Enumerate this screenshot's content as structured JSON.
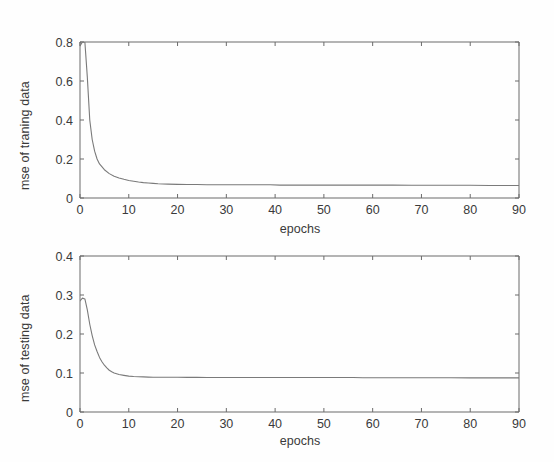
{
  "figure": {
    "background": "#fefefe",
    "axis_color": "#6b6b6b",
    "curve_color": "#7a7a7a",
    "text_color": "#3a3a3a"
  },
  "chart_data": [
    {
      "type": "line",
      "id": "training-mse",
      "title": "",
      "xlabel": "epochs",
      "ylabel": "mse of traning data",
      "xlim": [
        0,
        90
      ],
      "ylim": [
        0,
        0.8
      ],
      "xticks": [
        0,
        10,
        20,
        30,
        40,
        50,
        60,
        70,
        80,
        90
      ],
      "xticklabels": [
        "0",
        "10",
        "20",
        "30",
        "40",
        "50",
        "60",
        "70",
        "80",
        "90"
      ],
      "yticks": [
        0,
        0.2,
        0.4,
        0.6,
        0.8
      ],
      "yticklabels": [
        "0",
        "0.2",
        "0.4",
        "0.6",
        "0.8"
      ],
      "grid": false,
      "legend": "none",
      "series": [
        {
          "name": "mse of traning data",
          "x": [
            0,
            0.5,
            1,
            1.5,
            2,
            2.5,
            3,
            3.5,
            4,
            5,
            6,
            7,
            8,
            9,
            10,
            11,
            12,
            13,
            14,
            15,
            16,
            18,
            20,
            22,
            24,
            26,
            28,
            30,
            33,
            36,
            39,
            41,
            44,
            48,
            52,
            56,
            60,
            64,
            68,
            72,
            76,
            80,
            84,
            88,
            90
          ],
          "y": [
            0.78,
            0.8,
            0.8,
            0.62,
            0.4,
            0.3,
            0.24,
            0.2,
            0.175,
            0.145,
            0.125,
            0.112,
            0.103,
            0.096,
            0.09,
            0.086,
            0.082,
            0.079,
            0.077,
            0.075,
            0.073,
            0.071,
            0.07,
            0.069,
            0.069,
            0.068,
            0.068,
            0.068,
            0.068,
            0.068,
            0.068,
            0.066,
            0.066,
            0.066,
            0.066,
            0.066,
            0.066,
            0.066,
            0.065,
            0.065,
            0.065,
            0.065,
            0.064,
            0.064,
            0.064
          ]
        }
      ]
    },
    {
      "type": "line",
      "id": "testing-mse",
      "title": "",
      "xlabel": "epochs",
      "ylabel": "mse of testing data",
      "xlim": [
        0,
        90
      ],
      "ylim": [
        0,
        0.4
      ],
      "xticks": [
        0,
        10,
        20,
        30,
        40,
        50,
        60,
        70,
        80,
        90
      ],
      "xticklabels": [
        "0",
        "10",
        "20",
        "30",
        "40",
        "50",
        "60",
        "70",
        "80",
        "90"
      ],
      "yticks": [
        0,
        0.1,
        0.2,
        0.3,
        0.4
      ],
      "yticklabels": [
        "0",
        "0.1",
        "0.2",
        "0.3",
        "0.4"
      ],
      "grid": false,
      "legend": "none",
      "series": [
        {
          "name": "mse of testing data",
          "x": [
            0,
            0.5,
            1,
            1.5,
            2,
            2.5,
            3,
            3.5,
            4,
            4.5,
            5,
            5.5,
            6,
            6.5,
            7,
            8,
            9,
            10,
            11,
            12,
            13,
            14,
            15,
            16,
            18,
            20,
            22,
            24,
            26,
            28,
            30,
            33,
            36,
            39,
            41,
            44,
            48,
            52,
            56,
            58,
            60,
            64,
            68,
            72,
            76,
            80,
            84,
            88,
            90
          ],
          "y": [
            0.285,
            0.292,
            0.29,
            0.262,
            0.225,
            0.196,
            0.172,
            0.155,
            0.14,
            0.129,
            0.12,
            0.113,
            0.107,
            0.103,
            0.1,
            0.096,
            0.094,
            0.092,
            0.091,
            0.0905,
            0.09,
            0.0895,
            0.089,
            0.089,
            0.089,
            0.089,
            0.0888,
            0.0888,
            0.0886,
            0.0886,
            0.0885,
            0.0885,
            0.0885,
            0.0884,
            0.0884,
            0.0884,
            0.0883,
            0.0883,
            0.0883,
            0.0878,
            0.0878,
            0.0878,
            0.0877,
            0.0877,
            0.0877,
            0.0876,
            0.0876,
            0.0876,
            0.0876
          ]
        }
      ]
    }
  ]
}
